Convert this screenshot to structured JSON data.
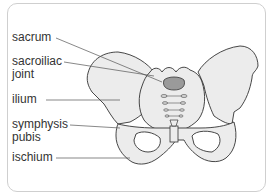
{
  "labels": {
    "sacrum": "sacrum",
    "sacroiliac_1": "sacroiliac",
    "sacroiliac_2": "joint",
    "ilium": "ilium",
    "symphysis_1": "symphysis",
    "symphysis_2": "pubis",
    "ischium": "ischium"
  },
  "colors": {
    "bone_fill": "#ececec",
    "sacrum_highlight": "#9a9a9a",
    "outline": "#333333",
    "border": "#cfcfcf"
  }
}
